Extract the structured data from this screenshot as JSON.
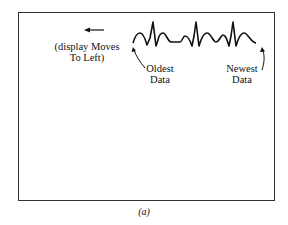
{
  "figure": {
    "caption": "(a)",
    "display_direction_label_line1": "(display Moves",
    "display_direction_label_line2": "To Left)",
    "oldest_label_line1": "Oldest",
    "oldest_label_line2": "Data",
    "newest_label_line1": "Newest",
    "newest_label_line2": "Data",
    "arrow_direction": "left",
    "waveform": "repeating ECG-like trace with three sharp spikes",
    "colors": {
      "ink": "#111111",
      "frame": "#333333",
      "background": "#ffffff"
    }
  }
}
